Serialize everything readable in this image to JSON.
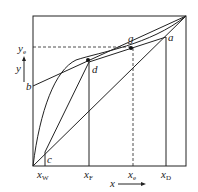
{
  "diagram": {
    "type": "McCabe-Thiele y-x diagram",
    "axes": {
      "x_label": "x",
      "y_label": "y",
      "x_ticks": [
        {
          "main": "x",
          "sub": "W"
        },
        {
          "main": "x",
          "sub": "F"
        },
        {
          "main": "x",
          "sub": "e"
        },
        {
          "main": "x",
          "sub": "D"
        }
      ],
      "y_ticks": [
        {
          "main": "y",
          "sub": "e"
        }
      ]
    },
    "points": {
      "a": "a",
      "b": "b",
      "c": "c",
      "d": "d",
      "g": "g"
    },
    "colors": {
      "line": "#1a1a1a",
      "background": "#ffffff"
    }
  }
}
